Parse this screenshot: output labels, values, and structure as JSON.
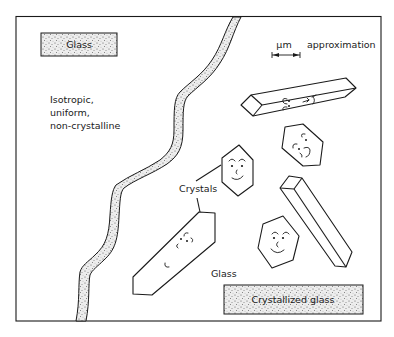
{
  "figure": {
    "type": "schematic illustration"
  },
  "regions": {
    "left": {
      "label_box": "Glass",
      "description_lines": [
        "Isotropic,",
        "uniform,",
        "non-crystalline"
      ]
    },
    "right": {
      "label_box": "Crystallized glass",
      "matrix_label": "Glass",
      "crystals_label": "Crystals",
      "scale_bar": {
        "unit": "μm",
        "caption": "approximation"
      }
    }
  },
  "colors": {
    "line": "#1a1a1a",
    "stipple_fill": "#d9d9d9",
    "background": "#ffffff"
  },
  "crystals": [
    {
      "shape": "elongated prism",
      "position": "upper-right",
      "face": "smiling-sideways"
    },
    {
      "shape": "hexagon",
      "position": "center",
      "face": "smiling"
    },
    {
      "shape": "hexagon",
      "position": "right-middle",
      "face": "tilted"
    },
    {
      "shape": "elongated prism",
      "position": "lower-left-center",
      "face": "tilted"
    },
    {
      "shape": "long prism",
      "position": "lower-right",
      "face": "none"
    },
    {
      "shape": "hexagon",
      "position": "lower-right",
      "face": "smiling"
    }
  ]
}
